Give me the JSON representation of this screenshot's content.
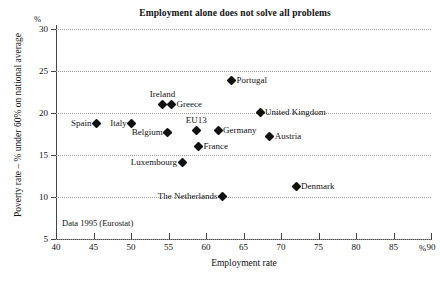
{
  "chart_data": {
    "type": "scatter",
    "title": "Employment alone does not solve all problems",
    "xlabel": "Employment rate",
    "ylabel": "Poverty rate – % under 60% on national average",
    "x_unit": "%",
    "y_unit": "%",
    "xlim": [
      40,
      90
    ],
    "ylim": [
      5,
      30
    ],
    "xticks": [
      40,
      45,
      50,
      55,
      60,
      65,
      70,
      75,
      80,
      85,
      90
    ],
    "yticks": [
      5,
      10,
      15,
      20,
      25,
      30
    ],
    "grid": "horizontal dotted gridlines at each y tick",
    "legend": "none (points labelled directly)",
    "source_note": "Data 1995 (Eurostat)",
    "points": [
      {
        "name": "Spain",
        "x": 45.4,
        "y": 18.7,
        "label_pos": "left"
      },
      {
        "name": "Italy",
        "x": 50.1,
        "y": 18.7,
        "label_pos": "left"
      },
      {
        "name": "Ireland",
        "x": 54.2,
        "y": 21.0,
        "label_pos": "above"
      },
      {
        "name": "Greece",
        "x": 55.4,
        "y": 21.0,
        "label_pos": "right"
      },
      {
        "name": "Belgium",
        "x": 54.9,
        "y": 17.7,
        "label_pos": "left"
      },
      {
        "name": "Luxembourg",
        "x": 56.8,
        "y": 14.1,
        "label_pos": "left"
      },
      {
        "name": "EU13",
        "x": 58.7,
        "y": 17.9,
        "label_pos": "above"
      },
      {
        "name": "France",
        "x": 59.0,
        "y": 16.0,
        "label_pos": "right"
      },
      {
        "name": "Germany",
        "x": 61.6,
        "y": 17.9,
        "label_pos": "right"
      },
      {
        "name": "The Netherlands",
        "x": 62.2,
        "y": 10.1,
        "label_pos": "left"
      },
      {
        "name": "Portugal",
        "x": 63.4,
        "y": 23.9,
        "label_pos": "right"
      },
      {
        "name": "United Kingdom",
        "x": 67.2,
        "y": 20.1,
        "label_pos": "right"
      },
      {
        "name": "Austria",
        "x": 68.5,
        "y": 17.2,
        "label_pos": "right"
      },
      {
        "name": "Denmark",
        "x": 72.0,
        "y": 11.3,
        "label_pos": "right"
      }
    ],
    "colors": {
      "marker": "#111111",
      "axis": "#444444",
      "grid": "#9a9a9a",
      "background": "#ffffff"
    }
  }
}
